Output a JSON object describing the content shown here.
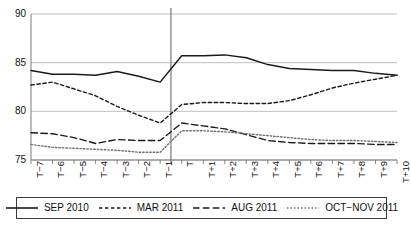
{
  "chart_data": {
    "type": "line",
    "title": "",
    "xlabel": "",
    "ylabel": "",
    "ylim": [
      75,
      90
    ],
    "yticks": [
      75,
      80,
      85,
      90
    ],
    "grid": true,
    "legend_position": "bottom",
    "annotations": [
      {
        "type": "vertical-line",
        "at": "between T-1 and T",
        "label": ""
      }
    ],
    "categories": [
      "T−7",
      "T−6",
      "T−5",
      "T−4",
      "T−3",
      "T−2",
      "T−1",
      "T",
      "T+1",
      "T+2",
      "T+3",
      "T+4",
      "T+5",
      "T+6",
      "T+7",
      "T+8",
      "T+9",
      "T+10"
    ],
    "series": [
      {
        "name": "SEP 2010",
        "style": "solid",
        "color": "#1a1a1a",
        "values": [
          84.2,
          83.8,
          83.8,
          83.7,
          84.1,
          83.6,
          83.0,
          85.7,
          85.7,
          85.8,
          85.5,
          84.8,
          84.4,
          84.3,
          84.2,
          84.2,
          83.9,
          83.7
        ]
      },
      {
        "name": "MAR 2011",
        "style": "dotted-dash",
        "color": "#1a1a1a",
        "values": [
          82.7,
          83.0,
          82.3,
          81.6,
          80.5,
          79.6,
          78.8,
          80.7,
          80.9,
          80.9,
          80.8,
          80.8,
          81.1,
          81.7,
          82.4,
          82.9,
          83.3,
          83.7
        ]
      },
      {
        "name": "AUG 2011",
        "style": "dashed",
        "color": "#1a1a1a",
        "values": [
          77.8,
          77.7,
          77.3,
          76.7,
          77.1,
          77.0,
          77.0,
          78.8,
          78.5,
          78.2,
          77.6,
          77.0,
          76.8,
          76.7,
          76.7,
          76.7,
          76.6,
          76.6
        ]
      },
      {
        "name": "OCT−NOV 2011",
        "style": "dotted",
        "color": "#6e6e6e",
        "values": [
          76.6,
          76.3,
          76.2,
          76.1,
          76.0,
          75.8,
          75.8,
          78.0,
          78.0,
          77.9,
          77.7,
          77.5,
          77.3,
          77.1,
          77.0,
          77.0,
          76.9,
          76.8
        ]
      }
    ]
  },
  "axis": {
    "y_tick_labels": [
      "90",
      "85",
      "80",
      "75"
    ],
    "x_tick_labels": [
      "T−7",
      "T−6",
      "T−5",
      "T−4",
      "T−3",
      "T−2",
      "T−1",
      "T",
      "T+1",
      "T+2",
      "T+3",
      "T+4",
      "T+5",
      "T+6",
      "T+7",
      "T+8",
      "T+9",
      "T+10"
    ]
  },
  "legend": {
    "entries": [
      {
        "label": "SEP 2010",
        "key": "solid-line-key"
      },
      {
        "label": "MAR 2011",
        "key": "dotted-dash-line-key"
      },
      {
        "label": "AUG 2011",
        "key": "dashed-line-key"
      },
      {
        "label": "OCT−NOV 2011",
        "key": "dotted-line-key"
      }
    ]
  }
}
